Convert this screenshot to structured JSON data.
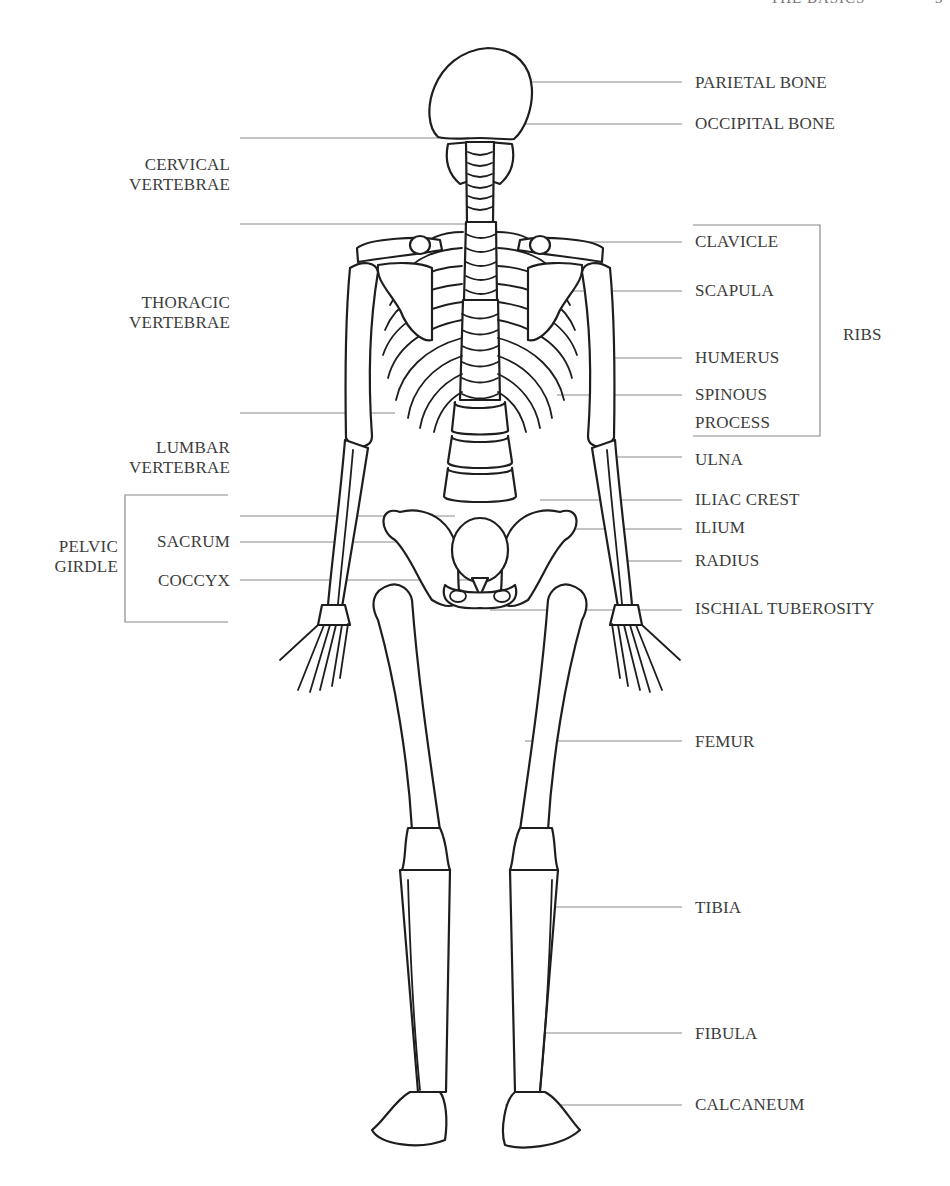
{
  "header": {
    "running_title": "THE BASICS",
    "page_number": "3"
  },
  "labels_right": [
    {
      "id": "parietal-bone",
      "text": "PARIETAL BONE",
      "x": 695,
      "y": 73
    },
    {
      "id": "occipital-bone",
      "text": "OCCIPITAL BONE",
      "x": 695,
      "y": 114
    },
    {
      "id": "clavicle",
      "text": "CLAVICLE",
      "x": 695,
      "y": 232
    },
    {
      "id": "scapula",
      "text": "SCAPULA",
      "x": 695,
      "y": 281
    },
    {
      "id": "humerus",
      "text": "HUMERUS",
      "x": 695,
      "y": 348
    },
    {
      "id": "spinous-process-1",
      "text": "SPINOUS",
      "x": 695,
      "y": 385
    },
    {
      "id": "spinous-process-2",
      "text": "PROCESS",
      "x": 695,
      "y": 413
    },
    {
      "id": "ulna",
      "text": "ULNA",
      "x": 695,
      "y": 450
    },
    {
      "id": "iliac-crest",
      "text": "ILIAC CREST",
      "x": 695,
      "y": 490
    },
    {
      "id": "ilium",
      "text": "ILIUM",
      "x": 695,
      "y": 518
    },
    {
      "id": "radius",
      "text": "RADIUS",
      "x": 695,
      "y": 551
    },
    {
      "id": "ischial-tuberosity",
      "text": "ISCHIAL TUBEROSITY",
      "x": 695,
      "y": 599
    },
    {
      "id": "femur",
      "text": "FEMUR",
      "x": 695,
      "y": 732
    },
    {
      "id": "tibia",
      "text": "TIBIA",
      "x": 695,
      "y": 898
    },
    {
      "id": "fibula",
      "text": "FIBULA",
      "x": 695,
      "y": 1024
    },
    {
      "id": "calcaneum",
      "text": "CALCANEUM",
      "x": 695,
      "y": 1095
    }
  ],
  "ribs_label": {
    "text": "RIBS",
    "x": 843,
    "y": 325
  },
  "labels_left": [
    {
      "id": "cervical-vertebrae",
      "lines": [
        "CERVICAL",
        "VERTEBRAE"
      ],
      "right": 230,
      "y": 155
    },
    {
      "id": "thoracic-vertebrae",
      "lines": [
        "THORACIC",
        "VERTEBRAE"
      ],
      "right": 230,
      "y": 293
    },
    {
      "id": "lumbar-vertebrae",
      "lines": [
        "LUMBAR",
        "VERTEBRAE"
      ],
      "right": 230,
      "y": 438
    },
    {
      "id": "sacrum",
      "lines": [
        "SACRUM"
      ],
      "right": 230,
      "y": 532
    },
    {
      "id": "coccyx",
      "lines": [
        "COCCYX"
      ],
      "right": 230,
      "y": 571
    },
    {
      "id": "pelvic-girdle",
      "lines": [
        "PELVIC",
        "GIRDLE"
      ],
      "right": 118,
      "y": 537
    }
  ]
}
